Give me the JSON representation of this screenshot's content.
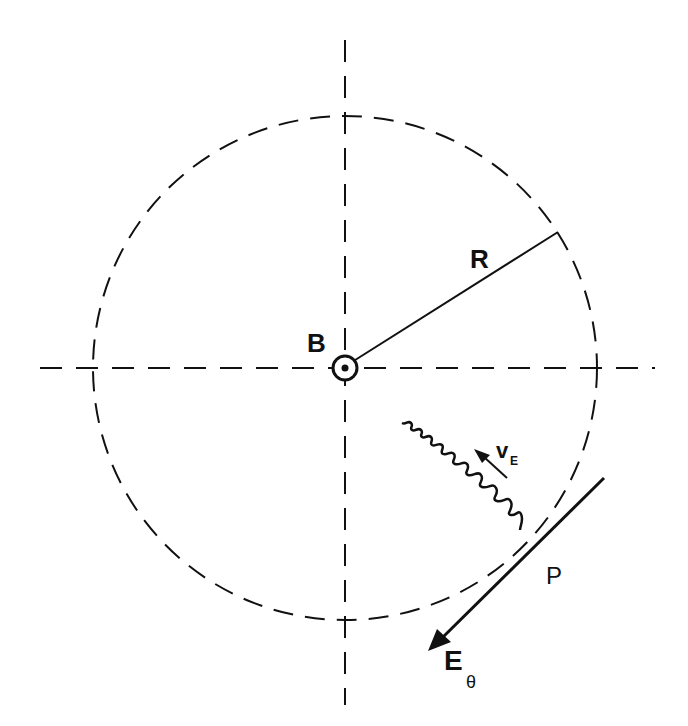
{
  "diagram": {
    "colors": {
      "ink": "#111111",
      "background": "#ffffff"
    },
    "labels": {
      "magnetic_field": "B",
      "radius": "R",
      "drift_velocity": "v",
      "drift_velocity_subscript": "E",
      "point": "P",
      "electric_field": "E",
      "electric_field_subscript": "θ"
    },
    "geometry": {
      "center": [
        345,
        368
      ],
      "circle_radius": 252,
      "circle_style": "dashed",
      "axes_style": "dashed",
      "radius_line_end": [
        558,
        232
      ],
      "point_P": [
        520,
        545
      ],
      "tangent_line": {
        "from": [
          604,
          478
        ],
        "to": [
          428,
          651
        ],
        "arrowhead_at": "to"
      },
      "drift_arrow": {
        "from": [
          507,
          478
        ],
        "to": [
          478,
          452
        ]
      }
    }
  }
}
